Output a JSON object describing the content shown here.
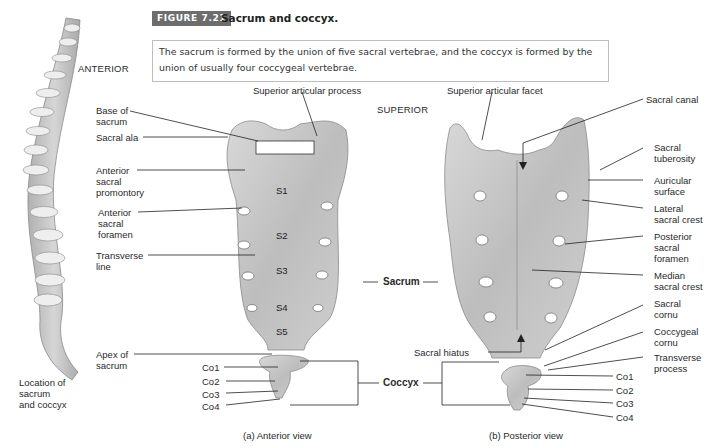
{
  "figure": {
    "badge": "FIGURE 7.21",
    "title": "Sacrum and coccyx.",
    "caption": "The sacrum is formed by the union of five sacral vertebrae, and the coccyx is formed by the union of usually four coccygeal vertebrae."
  },
  "spine_panel": {
    "orientation_label": "ANTERIOR",
    "caption_lines": [
      "Location of",
      "sacrum",
      "and coccyx"
    ]
  },
  "anterior_view": {
    "subtitle": "(a) Anterior view",
    "labels": {
      "base_of_sacrum": [
        "Base of",
        "sacrum"
      ],
      "sacral_ala": "Sacral ala",
      "anterior_sacral_promontory": [
        "Anterior",
        "sacral",
        "promontory"
      ],
      "anterior_sacral_foramen": [
        "Anterior",
        "sacral",
        "foramen"
      ],
      "transverse_line": [
        "Transverse",
        "line"
      ],
      "apex_of_sacrum": [
        "Apex of",
        "sacrum"
      ],
      "superior_articular_process": "Superior articular process"
    },
    "segments": [
      "S1",
      "S2",
      "S3",
      "S4",
      "S5"
    ],
    "coccyx_segments": [
      "Co1",
      "Co2",
      "Co3",
      "Co4"
    ]
  },
  "center_labels": {
    "sacrum": "Sacrum",
    "coccyx": "Coccyx",
    "superior": "SUPERIOR"
  },
  "posterior_view": {
    "subtitle": "(b) Posterior view",
    "labels": {
      "superior_articular_facet": "Superior articular facet",
      "sacral_canal": "Sacral canal",
      "sacral_tuberosity": [
        "Sacral",
        "tuberosity"
      ],
      "auricular_surface": [
        "Auricular",
        "surface"
      ],
      "lateral_sacral_crest": [
        "Lateral",
        "sacral crest"
      ],
      "posterior_sacral_foramen": [
        "Posterior",
        "sacral",
        "foramen"
      ],
      "median_sacral_crest": [
        "Median",
        "sacral crest"
      ],
      "sacral_cornu": [
        "Sacral",
        "cornu"
      ],
      "coccygeal_cornu": [
        "Coccygeal",
        "cornu"
      ],
      "transverse_process": [
        "Transverse",
        "process"
      ],
      "sacral_hiatus": "Sacral hiatus"
    },
    "coccyx_segments": [
      "Co1",
      "Co2",
      "Co3",
      "Co4"
    ]
  },
  "colors": {
    "bone": "#c9c9c9",
    "bone_dark": "#8e8e8e",
    "badge": "#6d6d6d",
    "leader": "#222222"
  }
}
